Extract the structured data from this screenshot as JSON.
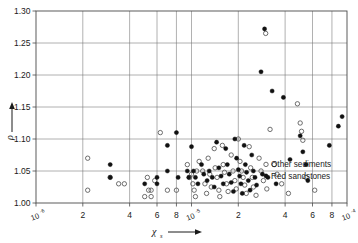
{
  "chart_data": {
    "type": "scatter",
    "title": "",
    "xlabel": "χs",
    "ylabel": "ρ",
    "xscale": "log",
    "yscale": "linear",
    "xlim": [
      1e-06,
      0.0001
    ],
    "ylim": [
      1.0,
      1.3
    ],
    "grid": true,
    "legend_position": "bottom-right",
    "x_tick_labels": [
      "10⁻⁶",
      "2",
      "4",
      "6",
      "8",
      "10⁻⁵",
      "2",
      "4",
      "6",
      "8",
      "10⁻⁴"
    ],
    "x_tick_values": [
      1e-06,
      2e-06,
      4e-06,
      6e-06,
      8e-06,
      1e-05,
      2e-05,
      4e-05,
      6e-05,
      8e-05,
      0.0001
    ],
    "y_tick_labels": [
      "1.00",
      "1.05",
      "1.10",
      "1.15",
      "1.20",
      "1.25",
      "1.30"
    ],
    "y_tick_values": [
      1.0,
      1.05,
      1.1,
      1.15,
      1.2,
      1.25,
      1.3
    ],
    "series": [
      {
        "name": "Other sediments",
        "marker": "open-circle",
        "color": "#555555",
        "points": [
          [
            2.15e-06,
            1.07
          ],
          [
            2.15e-06,
            1.02
          ],
          [
            3e-06,
            1.04
          ],
          [
            3.4e-06,
            1.03
          ],
          [
            3.7e-06,
            1.03
          ],
          [
            5e-06,
            1.01
          ],
          [
            5.2e-06,
            1.04
          ],
          [
            5.3e-06,
            1.02
          ],
          [
            5.5e-06,
            1.02
          ],
          [
            5.5e-06,
            1.01
          ],
          [
            5.8e-06,
            1.035
          ],
          [
            6.3e-06,
            1.11
          ],
          [
            7e-06,
            1.02
          ],
          [
            8e-06,
            1.02
          ],
          [
            9.4e-06,
            1.06
          ],
          [
            9.7e-06,
            1.04
          ],
          [
            1e-05,
            1.045
          ],
          [
            1.02e-05,
            1.03
          ],
          [
            1.04e-05,
            1.02
          ],
          [
            1.06e-05,
            1.01
          ],
          [
            1.08e-05,
            1.05
          ],
          [
            1.12e-05,
            1.065
          ],
          [
            1.18e-05,
            1.05
          ],
          [
            1.22e-05,
            1.03
          ],
          [
            1.25e-05,
            1.015
          ],
          [
            1.28e-05,
            1.07
          ],
          [
            1.31e-05,
            1.045
          ],
          [
            1.34e-05,
            1.025
          ],
          [
            1.4e-05,
            1.085
          ],
          [
            1.42e-05,
            1.055
          ],
          [
            1.46e-05,
            1.04
          ],
          [
            1.5e-05,
            1.02
          ],
          [
            1.52e-05,
            1.01
          ],
          [
            1.58e-05,
            1.09
          ],
          [
            1.6e-05,
            1.06
          ],
          [
            1.63e-05,
            1.048
          ],
          [
            1.68e-05,
            1.03
          ],
          [
            1.72e-05,
            1.018
          ],
          [
            1.8e-05,
            1.075
          ],
          [
            1.85e-05,
            1.05
          ],
          [
            1.9e-05,
            1.035
          ],
          [
            1.94e-05,
            1.022
          ],
          [
            2e-05,
            1.1
          ],
          [
            2.05e-05,
            1.065
          ],
          [
            2.1e-05,
            1.05
          ],
          [
            2.15e-05,
            1.04
          ],
          [
            2.2e-05,
            1.028
          ],
          [
            2.25e-05,
            1.015
          ],
          [
            2.35e-05,
            1.088
          ],
          [
            2.4e-05,
            1.055
          ],
          [
            2.46e-05,
            1.04
          ],
          [
            2.5e-05,
            1.025
          ],
          [
            2.6e-05,
            1.012
          ],
          [
            2.72e-05,
            1.07
          ],
          [
            2.8e-05,
            1.05
          ],
          [
            2.9e-05,
            1.035
          ],
          [
            3e-05,
            1.265
          ],
          [
            3.05e-05,
            1.022
          ],
          [
            3.2e-05,
            1.115
          ],
          [
            3.4e-05,
            1.06
          ],
          [
            3.55e-05,
            1.045
          ],
          [
            3.8e-05,
            1.03
          ],
          [
            4.2e-05,
            1.015
          ],
          [
            4.8e-05,
            1.155
          ],
          [
            5e-05,
            1.125
          ],
          [
            5.1e-05,
            1.112
          ],
          [
            5.2e-05,
            1.098
          ],
          [
            5.45e-05,
            1.04
          ],
          [
            6.2e-05,
            1.02
          ]
        ]
      },
      {
        "name": "Red sandstones",
        "marker": "filled-circle",
        "color": "#111111",
        "points": [
          [
            3e-06,
            1.06
          ],
          [
            3e-06,
            1.04
          ],
          [
            5e-06,
            1.03
          ],
          [
            6e-06,
            1.04
          ],
          [
            6e-06,
            1.03
          ],
          [
            7e-06,
            1.09
          ],
          [
            7e-06,
            1.05
          ],
          [
            8e-06,
            1.11
          ],
          [
            8.2e-06,
            1.04
          ],
          [
            9.4e-06,
            1.05
          ],
          [
            9.6e-06,
            1.04
          ],
          [
            1e-05,
            1.088
          ],
          [
            1.03e-05,
            1.05
          ],
          [
            1.06e-05,
            1.04
          ],
          [
            1.1e-05,
            1.03
          ],
          [
            1.16e-05,
            1.06
          ],
          [
            1.2e-05,
            1.045
          ],
          [
            1.26e-05,
            1.035
          ],
          [
            1.3e-05,
            1.05
          ],
          [
            1.36e-05,
            1.04
          ],
          [
            1.4e-05,
            1.025
          ],
          [
            1.45e-05,
            1.095
          ],
          [
            1.5e-05,
            1.055
          ],
          [
            1.55e-05,
            1.042
          ],
          [
            1.6e-05,
            1.03
          ],
          [
            1.66e-05,
            1.085
          ],
          [
            1.7e-05,
            1.06
          ],
          [
            1.75e-05,
            1.045
          ],
          [
            1.8e-05,
            1.032
          ],
          [
            1.86e-05,
            1.018
          ],
          [
            1.9e-05,
            1.1
          ],
          [
            1.95e-05,
            1.07
          ],
          [
            2e-05,
            1.052
          ],
          [
            2.04e-05,
            1.042
          ],
          [
            2.08e-05,
            1.03
          ],
          [
            2.12e-05,
            1.015
          ],
          [
            2.18e-05,
            1.09
          ],
          [
            2.22e-05,
            1.06
          ],
          [
            2.26e-05,
            1.048
          ],
          [
            2.32e-05,
            1.035
          ],
          [
            2.38e-05,
            1.02
          ],
          [
            2.44e-05,
            1.075
          ],
          [
            2.5e-05,
            1.05
          ],
          [
            2.56e-05,
            1.04
          ],
          [
            2.62e-05,
            1.028
          ],
          [
            2.8e-05,
            1.205
          ],
          [
            2.86e-05,
            1.045
          ],
          [
            2.95e-05,
            1.272
          ],
          [
            3.1e-05,
            1.04
          ],
          [
            3.3e-05,
            1.175
          ],
          [
            3.5e-05,
            1.03
          ],
          [
            3.9e-05,
            1.165
          ],
          [
            4.3e-05,
            1.068
          ],
          [
            5e-05,
            1.105
          ],
          [
            5.2e-05,
            1.08
          ],
          [
            5.45e-05,
            1.06
          ],
          [
            5.6e-05,
            1.035
          ],
          [
            7.7e-05,
            1.09
          ],
          [
            8.8e-05,
            1.12
          ],
          [
            9.3e-05,
            1.135
          ]
        ]
      }
    ]
  },
  "legend": {
    "entries": [
      {
        "label": "Other sediments",
        "marker": "open-circle"
      },
      {
        "label": "Red sandstones",
        "marker": "filled-circle"
      }
    ]
  },
  "axes": {
    "y_axis_name": "rho-axis",
    "x_axis_name": "chi-s-axis"
  }
}
